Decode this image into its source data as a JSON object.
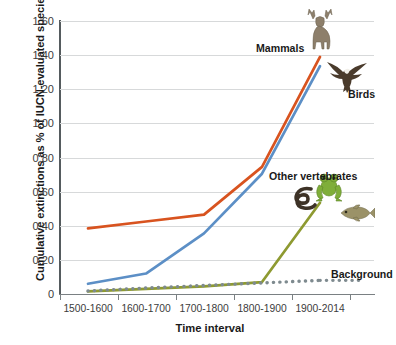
{
  "chart_data": {
    "type": "line",
    "title": "",
    "xlabel": "Time interval",
    "ylabel": "Cumulative extinctions as % of IUCN-evaluated species",
    "categories": [
      "1500-1600",
      "1600-1700",
      "1700-1800",
      "1800-1900",
      "1900-2014"
    ],
    "ylim": [
      0,
      1.6
    ],
    "ytick_labels": [
      "0",
      "0.20",
      "0.40",
      "0.60",
      "0.80",
      "1.00",
      "1.20",
      "1.40",
      "1.60"
    ],
    "ytick_values": [
      0,
      0.2,
      0.4,
      0.6,
      0.8,
      1.0,
      1.2,
      1.4,
      1.6
    ],
    "grid": "horizontal",
    "legend_position": "inline-annotations",
    "series": [
      {
        "name": "Mammals",
        "color": "#D8531F",
        "style": "solid",
        "values": [
          0.385,
          0.425,
          0.465,
          0.745,
          1.39
        ]
      },
      {
        "name": "Birds",
        "color": "#5C8FC6",
        "style": "solid",
        "values": [
          0.06,
          0.12,
          0.355,
          0.705,
          1.335
        ]
      },
      {
        "name": "Other vertebrates",
        "color": "#8E9A31",
        "style": "solid",
        "values": [
          0.015,
          0.03,
          0.045,
          0.07,
          0.535
        ]
      },
      {
        "name": "Background",
        "color": "#7E8A8F",
        "style": "dotted",
        "values": [
          0.018,
          0.035,
          0.05,
          0.065,
          0.08
        ]
      }
    ],
    "annotations": [
      {
        "label": "Mammals",
        "series": "Mammals"
      },
      {
        "label": "Birds",
        "series": "Birds"
      },
      {
        "label": "Other vertebrates",
        "series": "Other vertebrates"
      },
      {
        "label": "Background",
        "series": "Background"
      }
    ],
    "pictograms": [
      "deer-icon",
      "eagle-icon",
      "snake-icon",
      "frog-icon",
      "fish-icon"
    ]
  }
}
